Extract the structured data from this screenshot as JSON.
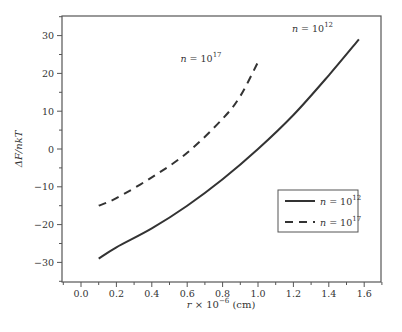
{
  "chart_data": {
    "type": "line",
    "title": "",
    "xlabel": "r × 10^-6 (cm)",
    "xlabel_parts": {
      "var": "r",
      "mult": " × 10",
      "exp": "−6",
      "unit": " (cm)"
    },
    "ylabel": "ΔF/nkT",
    "xlim": [
      -0.1,
      1.7
    ],
    "ylim": [
      -35,
      35
    ],
    "x_ticks": [
      0.0,
      0.2,
      0.4,
      0.6,
      0.8,
      1.0,
      1.2,
      1.4,
      1.6
    ],
    "x_tick_labels": [
      "0.0",
      "0.2",
      "0.4",
      "0.6",
      "0.8",
      "1.0",
      "1.2",
      "1.4",
      "1.6"
    ],
    "y_ticks": [
      30,
      20,
      10,
      0,
      -10,
      -20,
      -30
    ],
    "y_tick_labels": [
      "30",
      "20",
      "10",
      "0",
      "−10",
      "−20",
      "−30"
    ],
    "grid": false,
    "legend_position": "lower right",
    "series": [
      {
        "name": "n = 10^12",
        "label_base": "n = 10",
        "label_exp": "12",
        "style": "solid",
        "color": "#333333",
        "x": [
          0.1,
          0.2,
          0.4,
          0.6,
          0.8,
          1.0,
          1.2,
          1.4,
          1.57
        ],
        "values": [
          -29,
          -26,
          -21,
          -15,
          -8,
          0,
          9,
          19.5,
          29
        ]
      },
      {
        "name": "n = 10^17",
        "label_base": "n = 10",
        "label_exp": "17",
        "style": "dashed",
        "color": "#333333",
        "x": [
          0.1,
          0.2,
          0.4,
          0.6,
          0.8,
          0.9,
          1.0
        ],
        "values": [
          -15,
          -13,
          -7.5,
          -1,
          8,
          14,
          23
        ]
      }
    ],
    "annotations": [
      {
        "text_base": "n = 10",
        "text_exp": "12",
        "near_series": "n = 10^12",
        "x": 1.35,
        "y": 31
      },
      {
        "text_base": "n = 10",
        "text_exp": "17",
        "near_series": "n = 10^17",
        "x": 0.72,
        "y": 23
      }
    ]
  }
}
